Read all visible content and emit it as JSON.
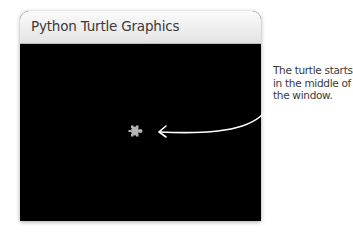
{
  "window": {
    "title": "Python Turtle Graphics",
    "canvas_color": "#000000"
  },
  "turtle": {
    "shape": "turtle-icon",
    "color": "#b4b4b4",
    "position": "center"
  },
  "annotation": {
    "text": "The turtle starts in the middle of the window.",
    "arrow_color": "#ffffff"
  }
}
